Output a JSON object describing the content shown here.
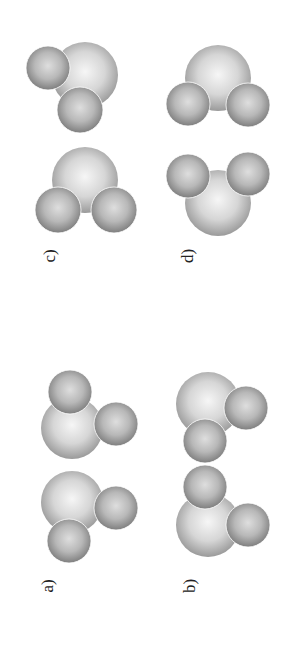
{
  "figure": {
    "orientation": "rotated-90-ccw",
    "labels": [
      {
        "id": "a",
        "text": "a)"
      },
      {
        "id": "b",
        "text": "b)"
      },
      {
        "id": "c",
        "text": "c)"
      },
      {
        "id": "d",
        "text": "d)"
      }
    ],
    "colors": {
      "background": "#ffffff",
      "large_atom_light": "#f4f4f4",
      "large_atom_dark": "#a8a8a8",
      "small_atom_light": "#d8d8d8",
      "small_atom_dark": "#8a8a8a"
    }
  }
}
